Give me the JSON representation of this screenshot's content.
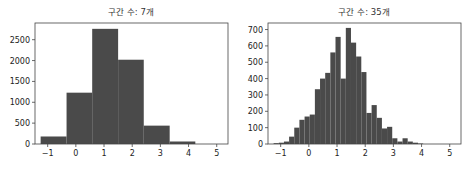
{
  "chart_data": [
    {
      "type": "bar",
      "title": "구간 수: 7개",
      "xlabel": "",
      "ylabel": "",
      "bar_color": "#4a4a4a",
      "bins": [
        {
          "x0": -1.25,
          "x1": -0.33,
          "count": 180
        },
        {
          "x0": -0.33,
          "x1": 0.58,
          "count": 1230
        },
        {
          "x0": 0.58,
          "x1": 1.5,
          "count": 2760
        },
        {
          "x0": 1.5,
          "x1": 2.41,
          "count": 2020
        },
        {
          "x0": 2.41,
          "x1": 3.33,
          "count": 440
        },
        {
          "x0": 3.33,
          "x1": 4.24,
          "count": 60
        },
        {
          "x0": 4.24,
          "x1": 5.16,
          "count": 0
        }
      ],
      "xticks": [
        -1,
        0,
        1,
        2,
        3,
        4,
        5
      ],
      "yticks": [
        0,
        500,
        1000,
        1500,
        2000,
        2500
      ],
      "xlim": [
        -1.45,
        5.4
      ],
      "ylim": [
        0,
        2900
      ],
      "grid": false
    },
    {
      "type": "bar",
      "title": "구간 수: 35개",
      "xlabel": "",
      "ylabel": "",
      "bar_color": "#4a4a4a",
      "bin_start": -1.25,
      "bin_width": 0.183,
      "counts": [
        5,
        8,
        15,
        45,
        100,
        148,
        168,
        180,
        335,
        400,
        435,
        560,
        655,
        400,
        710,
        620,
        535,
        440,
        190,
        238,
        160,
        95,
        105,
        35,
        15,
        35,
        15,
        8,
        3,
        0,
        0,
        0,
        0,
        0,
        0
      ],
      "xticks": [
        -1,
        0,
        1,
        2,
        3,
        4,
        5
      ],
      "yticks": [
        0,
        100,
        200,
        300,
        400,
        500,
        600,
        700
      ],
      "xlim": [
        -1.45,
        5.4
      ],
      "ylim": [
        0,
        740
      ],
      "grid": false
    }
  ]
}
